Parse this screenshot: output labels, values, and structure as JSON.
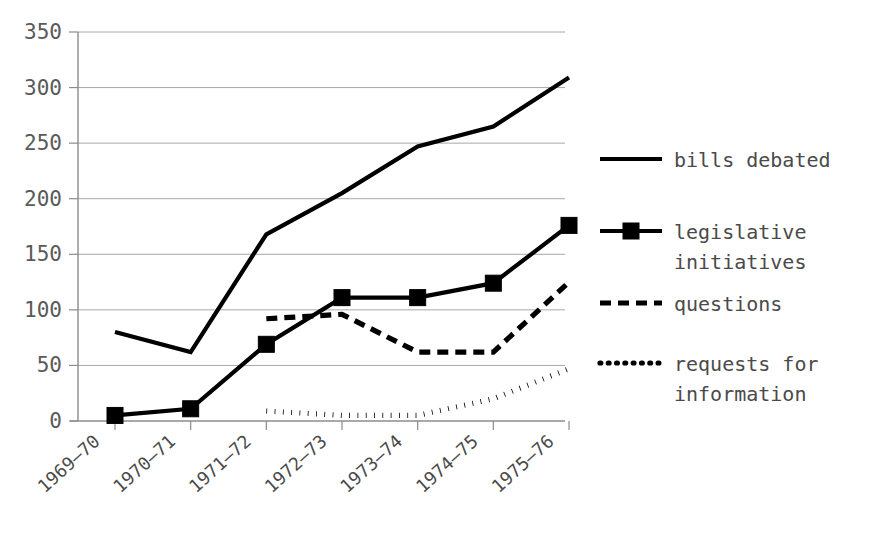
{
  "chart_data": {
    "type": "line",
    "title": "",
    "xlabel": "",
    "ylabel": "",
    "ylim": [
      0,
      350
    ],
    "ytick_step": 50,
    "grid": true,
    "legend_position": "right",
    "categories": [
      "1969–70",
      "1970–71",
      "1971–72",
      "1972–73",
      "1973–74",
      "1974–75",
      "1975–76"
    ],
    "yticks": [
      "0",
      "50",
      "100",
      "150",
      "200",
      "250",
      "300",
      "350"
    ],
    "ytick_values": [
      0,
      50,
      100,
      150,
      200,
      250,
      300,
      350
    ],
    "series": [
      {
        "name": "bills debated",
        "style": "solid",
        "marker": "none",
        "color": "#000000",
        "values": [
          80,
          62,
          168,
          205,
          247,
          265,
          309
        ],
        "start_index": 0
      },
      {
        "name": "legislative initiatives",
        "style": "solid",
        "marker": "square",
        "color": "#000000",
        "values": [
          5,
          11,
          69,
          111,
          111,
          124,
          176
        ],
        "start_index": 0
      },
      {
        "name": "questions",
        "style": "dashed",
        "marker": "none",
        "color": "#000000",
        "values": [
          null,
          null,
          92,
          96,
          62,
          62,
          125
        ],
        "start_index": 2
      },
      {
        "name": "requests for information",
        "style": "dotted",
        "marker": "none",
        "color": "#000000",
        "values": [
          null,
          null,
          9,
          5,
          5,
          20,
          47
        ],
        "start_index": 2
      }
    ]
  },
  "legend": {
    "entries": [
      {
        "label": "bills debated",
        "style": "solid",
        "marker": "none"
      },
      {
        "label": "legislative initiatives",
        "label_line1": "legislative",
        "label_line2": "initiatives",
        "style": "solid",
        "marker": "square"
      },
      {
        "label": "questions",
        "label_line1": "questions",
        "label_line2": "",
        "style": "dashed",
        "marker": "none"
      },
      {
        "label": "requests for information",
        "label_line1": "requests for",
        "label_line2": "information",
        "style": "dotted",
        "marker": "none"
      }
    ]
  },
  "colors": {
    "ink": "#000000",
    "grid": "#a8a8a8",
    "axis": "#8c8c8c",
    "text": "#4a4a4a",
    "background": "#ffffff"
  }
}
